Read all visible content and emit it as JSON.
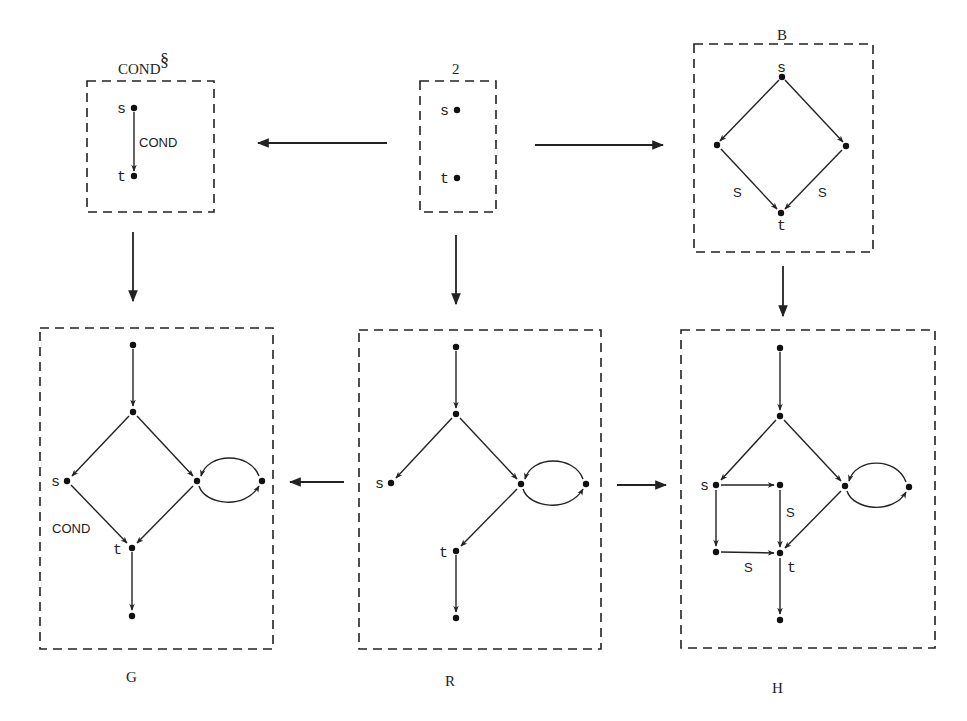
{
  "diagram": {
    "boxes": [
      {
        "id": "cond_sect",
        "title": "COND",
        "title_sup": "§",
        "x": 87,
        "y": 81,
        "w": 127,
        "h": 131,
        "title_x": 118,
        "title_y": 73
      },
      {
        "id": "two",
        "title": "2",
        "x": 420,
        "y": 81,
        "w": 76,
        "h": 131,
        "title_x": 456,
        "title_y": 73
      },
      {
        "id": "B",
        "title": "B",
        "x": 694,
        "y": 44,
        "w": 179,
        "h": 208,
        "title_x": 782,
        "title_y": 40
      },
      {
        "id": "G",
        "title": "G",
        "x": 40,
        "y": 328,
        "w": 233,
        "h": 286,
        "title_x": 130,
        "title_y": 682,
        "bottom": 649
      },
      {
        "id": "R",
        "title": "R",
        "x": 359,
        "y": 330,
        "w": 242,
        "h": 319,
        "title_x": 450,
        "title_y": 686
      },
      {
        "id": "H",
        "title": "H",
        "x": 681,
        "y": 330,
        "w": 254,
        "h": 318,
        "title_x": 776,
        "title_y": 692
      }
    ],
    "labels": {
      "cond_sect_title": "COND",
      "cond_sect_sup": "§",
      "two_title": "2",
      "B_title": "B",
      "G_title": "G",
      "R_title": "R",
      "H_title": "H",
      "cond_s": "s",
      "cond_t": "t",
      "cond_edge": "COND",
      "two_s": "s",
      "two_t": "t",
      "B_s": "s",
      "B_t": "t",
      "B_edge_left": "S",
      "B_edge_right": "S",
      "G_s": "s",
      "G_t": "t",
      "G_edge": "COND",
      "R_s": "s",
      "R_t": "t",
      "H_s": "s",
      "H_t": "t",
      "H_edge_vertical": "S",
      "H_edge_horizontal": "S"
    },
    "morphisms": [
      {
        "from": "two",
        "to": "cond_sect",
        "direction": "left"
      },
      {
        "from": "two",
        "to": "B",
        "direction": "right"
      },
      {
        "from": "cond_sect",
        "to": "G",
        "direction": "down"
      },
      {
        "from": "two",
        "to": "R",
        "direction": "down"
      },
      {
        "from": "B",
        "to": "H",
        "direction": "down"
      },
      {
        "from": "R",
        "to": "G",
        "direction": "left"
      },
      {
        "from": "R",
        "to": "H",
        "direction": "right"
      }
    ],
    "graphs": {
      "cond_sect": {
        "nodes": [
          {
            "id": "s",
            "x": 134,
            "y": 108
          },
          {
            "id": "t",
            "x": 134,
            "y": 176
          }
        ],
        "edges": [
          {
            "from": "s",
            "to": "t",
            "label": "COND"
          }
        ]
      },
      "two": {
        "nodes": [
          {
            "id": "s",
            "x": 457,
            "y": 110
          },
          {
            "id": "t",
            "x": 457,
            "y": 178
          }
        ],
        "edges": []
      },
      "B": {
        "nodes": [
          {
            "id": "s",
            "x": 782,
            "y": 77
          },
          {
            "id": "l",
            "x": 717,
            "y": 145
          },
          {
            "id": "r",
            "x": 846,
            "y": 146
          },
          {
            "id": "t",
            "x": 781,
            "y": 213
          }
        ],
        "edges": [
          {
            "from": "s",
            "to": "l"
          },
          {
            "from": "s",
            "to": "r"
          },
          {
            "from": "l",
            "to": "t",
            "label": "S"
          },
          {
            "from": "r",
            "to": "t",
            "label": "S"
          }
        ]
      },
      "G": {
        "nodes": [
          {
            "id": "top",
            "x": 133,
            "y": 345
          },
          {
            "id": "mid",
            "x": 133,
            "y": 412
          },
          {
            "id": "s",
            "x": 67,
            "y": 481
          },
          {
            "id": "r",
            "x": 197,
            "y": 481
          },
          {
            "id": "rr",
            "x": 262,
            "y": 481
          },
          {
            "id": "t",
            "x": 132,
            "y": 548
          },
          {
            "id": "bot",
            "x": 132,
            "y": 616
          }
        ],
        "edges": [
          {
            "from": "top",
            "to": "mid"
          },
          {
            "from": "mid",
            "to": "s"
          },
          {
            "from": "mid",
            "to": "r"
          },
          {
            "from": "s",
            "to": "t",
            "label": "COND"
          },
          {
            "from": "r",
            "to": "t"
          },
          {
            "from": "t",
            "to": "bot"
          },
          {
            "from": "r",
            "to": "rr",
            "curve": "loop-below"
          },
          {
            "from": "rr",
            "to": "r",
            "curve": "loop-above"
          }
        ]
      },
      "R": {
        "nodes": [
          {
            "id": "top",
            "x": 456,
            "y": 347
          },
          {
            "id": "mid",
            "x": 456,
            "y": 414
          },
          {
            "id": "s",
            "x": 391,
            "y": 483
          },
          {
            "id": "r",
            "x": 521,
            "y": 484
          },
          {
            "id": "rr",
            "x": 586,
            "y": 484
          },
          {
            "id": "t",
            "x": 456,
            "y": 551
          },
          {
            "id": "bot",
            "x": 456,
            "y": 618
          }
        ],
        "edges": [
          {
            "from": "top",
            "to": "mid"
          },
          {
            "from": "mid",
            "to": "s"
          },
          {
            "from": "mid",
            "to": "r"
          },
          {
            "from": "r",
            "to": "t"
          },
          {
            "from": "t",
            "to": "bot"
          },
          {
            "from": "r",
            "to": "rr",
            "curve": "loop-below"
          },
          {
            "from": "rr",
            "to": "r",
            "curve": "loop-above"
          }
        ]
      },
      "H": {
        "nodes": [
          {
            "id": "top",
            "x": 780,
            "y": 348
          },
          {
            "id": "mid",
            "x": 780,
            "y": 416
          },
          {
            "id": "s",
            "x": 716,
            "y": 485
          },
          {
            "id": "sr",
            "x": 780,
            "y": 485
          },
          {
            "id": "sb",
            "x": 716,
            "y": 552
          },
          {
            "id": "r",
            "x": 845,
            "y": 486
          },
          {
            "id": "rr",
            "x": 909,
            "y": 487
          },
          {
            "id": "t",
            "x": 780,
            "y": 553
          },
          {
            "id": "bot",
            "x": 780,
            "y": 620
          }
        ],
        "edges": [
          {
            "from": "top",
            "to": "mid"
          },
          {
            "from": "mid",
            "to": "s"
          },
          {
            "from": "mid",
            "to": "r"
          },
          {
            "from": "s",
            "to": "sr"
          },
          {
            "from": "s",
            "to": "sb"
          },
          {
            "from": "sr",
            "to": "t",
            "label": "S"
          },
          {
            "from": "sb",
            "to": "t",
            "label": "S"
          },
          {
            "from": "r",
            "to": "t"
          },
          {
            "from": "t",
            "to": "bot"
          },
          {
            "from": "r",
            "to": "rr",
            "curve": "loop-below"
          },
          {
            "from": "rr",
            "to": "r",
            "curve": "loop-above"
          }
        ]
      }
    }
  }
}
